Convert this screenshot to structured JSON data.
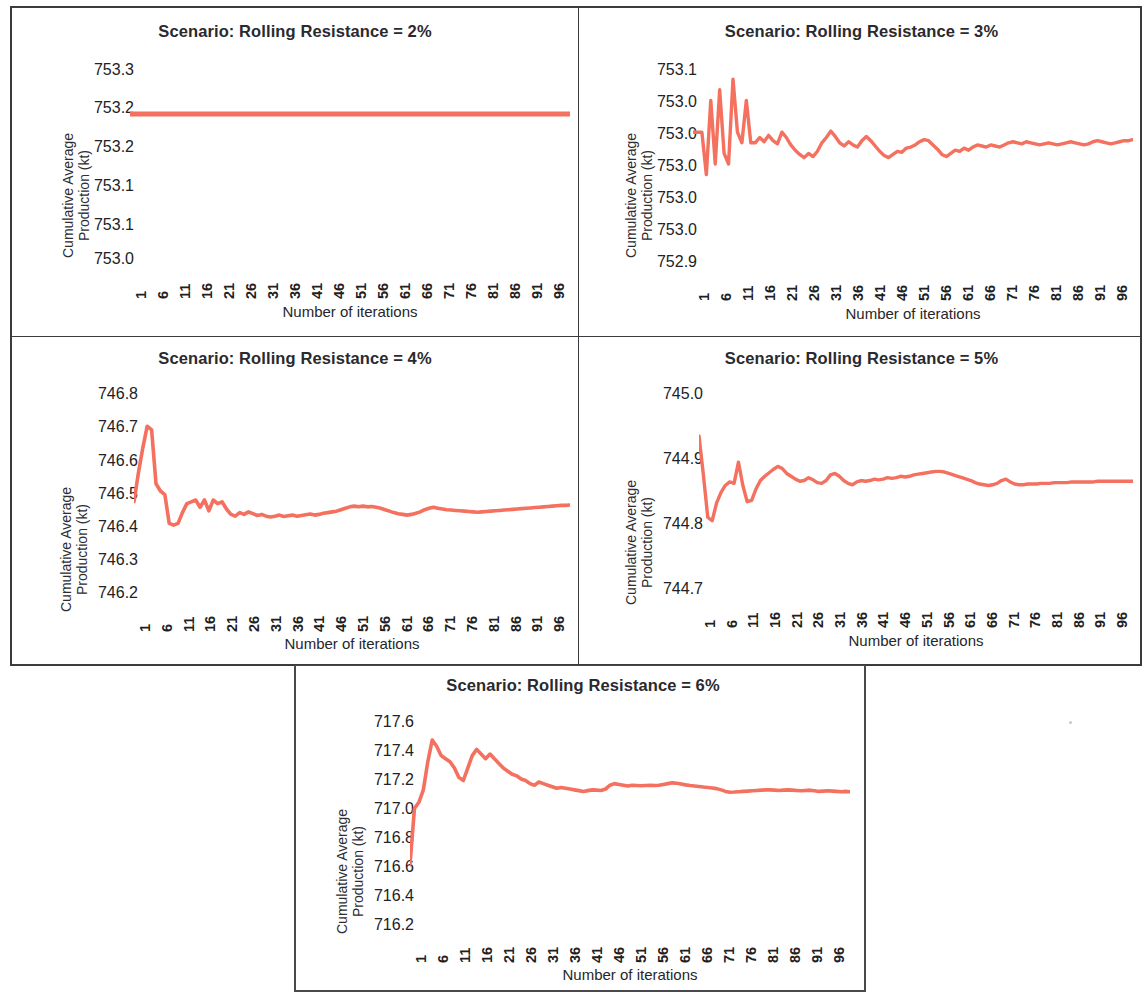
{
  "figure": {
    "panel_count": 5,
    "line_color": "#F4705F",
    "frame_color": "#3B3B3F",
    "background": "#FFFFFF",
    "shared_xlabel": "Number of iterations",
    "shared_ylabel_line1": "Cumulative Average",
    "shared_ylabel_line2": "Production (kt)",
    "shared_xticks": [
      "1",
      "6",
      "11",
      "16",
      "21",
      "26",
      "31",
      "36",
      "41",
      "46",
      "51",
      "56",
      "61",
      "66",
      "71",
      "76",
      "81",
      "86",
      "91",
      "96"
    ]
  },
  "chart_data": [
    {
      "id": "panel-1",
      "type": "line",
      "title": "Scenario: Rolling Resistance = 2%",
      "xlabel": "Number of iterations",
      "ylabel": "Cumulative Average Production (kt)",
      "ytick_labels": [
        "753.3",
        "753.2",
        "753.2",
        "753.1",
        "753.1",
        "753.0"
      ],
      "ylim": [
        753.0,
        753.3
      ],
      "xlim": [
        1,
        100
      ],
      "xtick_labels": [
        "1",
        "6",
        "11",
        "16",
        "21",
        "26",
        "31",
        "36",
        "41",
        "46",
        "51",
        "56",
        "61",
        "66",
        "71",
        "76",
        "81",
        "86",
        "91",
        "96"
      ],
      "grid": false,
      "legend": "none",
      "x": [
        1,
        2,
        3,
        4,
        5,
        6,
        7,
        8,
        9,
        10,
        11,
        12,
        13,
        14,
        15,
        16,
        17,
        18,
        19,
        20,
        21,
        22,
        23,
        24,
        25,
        26,
        27,
        28,
        29,
        30,
        31,
        32,
        33,
        34,
        35,
        36,
        37,
        38,
        39,
        40,
        41,
        42,
        43,
        44,
        45,
        46,
        47,
        48,
        49,
        50,
        51,
        52,
        53,
        54,
        55,
        56,
        57,
        58,
        59,
        60,
        61,
        62,
        63,
        64,
        65,
        66,
        67,
        68,
        69,
        70,
        71,
        72,
        73,
        74,
        75,
        76,
        77,
        78,
        79,
        80,
        81,
        82,
        83,
        84,
        85,
        86,
        87,
        88,
        89,
        90,
        91,
        92,
        93,
        94,
        95,
        96,
        97,
        98,
        99,
        100
      ],
      "values": [
        753.22,
        753.22,
        753.22,
        753.22,
        753.22,
        753.22,
        753.22,
        753.22,
        753.22,
        753.22,
        753.22,
        753.22,
        753.22,
        753.22,
        753.22,
        753.22,
        753.22,
        753.22,
        753.22,
        753.22,
        753.22,
        753.22,
        753.22,
        753.22,
        753.22,
        753.22,
        753.22,
        753.22,
        753.22,
        753.22,
        753.22,
        753.22,
        753.22,
        753.22,
        753.22,
        753.22,
        753.22,
        753.22,
        753.22,
        753.22,
        753.22,
        753.22,
        753.22,
        753.22,
        753.22,
        753.22,
        753.22,
        753.22,
        753.22,
        753.22,
        753.22,
        753.22,
        753.22,
        753.22,
        753.22,
        753.22,
        753.22,
        753.22,
        753.22,
        753.22,
        753.22,
        753.22,
        753.22,
        753.22,
        753.22,
        753.22,
        753.22,
        753.22,
        753.22,
        753.22,
        753.22,
        753.22,
        753.22,
        753.22,
        753.22,
        753.22,
        753.22,
        753.22,
        753.22,
        753.22,
        753.22,
        753.22,
        753.22,
        753.22,
        753.22,
        753.22,
        753.22,
        753.22,
        753.22,
        753.22,
        753.22,
        753.22,
        753.22,
        753.22,
        753.22,
        753.22,
        753.22,
        753.22,
        753.22,
        753.22
      ],
      "note": "Flat converged line at approximately 753.22 kt across all iterations"
    },
    {
      "id": "panel-2",
      "type": "line",
      "title": "Scenario: Rolling Resistance = 3%",
      "xlabel": "Number of iterations",
      "ylabel": "Cumulative Average Production (kt)",
      "ytick_labels": [
        "753.1",
        "753.0",
        "753.0",
        "753.0",
        "753.0",
        "753.0",
        "752.9"
      ],
      "ylim": [
        752.9,
        753.1
      ],
      "xlim": [
        1,
        100
      ],
      "xtick_labels": [
        "1",
        "6",
        "11",
        "16",
        "21",
        "26",
        "31",
        "36",
        "41",
        "46",
        "51",
        "56",
        "61",
        "66",
        "71",
        "76",
        "81",
        "86",
        "91",
        "96"
      ],
      "grid": false,
      "legend": "none",
      "values": [
        753.03,
        753.03,
        753.03,
        752.99,
        753.06,
        753.0,
        753.07,
        753.01,
        753.0,
        753.08,
        753.03,
        753.02,
        753.06,
        753.02,
        753.02,
        753.025,
        753.021,
        753.027,
        753.022,
        753.019,
        753.03,
        753.025,
        753.018,
        753.013,
        753.009,
        753.006,
        753.01,
        753.007,
        753.012,
        753.02,
        753.025,
        753.031,
        753.026,
        753.02,
        753.017,
        753.021,
        753.018,
        753.016,
        753.022,
        753.026,
        753.022,
        753.017,
        753.012,
        753.008,
        753.006,
        753.009,
        753.012,
        753.011,
        753.015,
        753.016,
        753.018,
        753.021,
        753.023,
        753.022,
        753.018,
        753.014,
        753.009,
        753.007,
        753.01,
        753.013,
        753.012,
        753.015,
        753.013,
        753.016,
        753.018,
        753.017,
        753.016,
        753.018,
        753.017,
        753.016,
        753.018,
        753.02,
        753.021,
        753.02,
        753.019,
        753.021,
        753.02,
        753.019,
        753.018,
        753.019,
        753.02,
        753.019,
        753.018,
        753.019,
        753.02,
        753.021,
        753.02,
        753.019,
        753.018,
        753.019,
        753.021,
        753.022,
        753.021,
        753.02,
        753.019,
        753.02,
        753.021,
        753.022,
        753.022,
        753.023
      ],
      "note": "High oscillation for first ~15 iterations then converging toward ~753.02 kt"
    },
    {
      "id": "panel-3",
      "type": "line",
      "title": "Scenario: Rolling Resistance = 4%",
      "xlabel": "Number of iterations",
      "ylabel": "Cumulative Average Production (kt)",
      "ytick_labels": [
        "746.8",
        "746.7",
        "746.6",
        "746.5",
        "746.4",
        "746.3",
        "746.2"
      ],
      "ylim": [
        746.2,
        746.8
      ],
      "xlim": [
        1,
        100
      ],
      "xtick_labels": [
        "1",
        "6",
        "11",
        "16",
        "21",
        "26",
        "31",
        "36",
        "41",
        "46",
        "51",
        "56",
        "61",
        "66",
        "71",
        "76",
        "81",
        "86",
        "91",
        "96"
      ],
      "grid": false,
      "legend": "none",
      "values": [
        746.47,
        746.55,
        746.62,
        746.68,
        746.67,
        746.52,
        746.5,
        746.49,
        746.41,
        746.405,
        746.41,
        746.44,
        746.465,
        746.47,
        746.475,
        746.455,
        746.475,
        746.445,
        746.475,
        746.465,
        746.47,
        746.45,
        746.435,
        746.43,
        746.44,
        746.435,
        746.442,
        746.437,
        746.432,
        746.435,
        746.43,
        746.428,
        746.43,
        746.433,
        746.429,
        746.431,
        746.433,
        746.43,
        746.432,
        746.434,
        746.436,
        746.433,
        746.435,
        746.438,
        746.44,
        746.442,
        746.444,
        746.448,
        746.452,
        746.456,
        746.458,
        746.456,
        746.458,
        746.456,
        746.457,
        746.455,
        746.452,
        746.448,
        746.444,
        746.44,
        746.437,
        746.435,
        746.433,
        746.435,
        746.438,
        746.442,
        746.448,
        746.452,
        746.455,
        746.452,
        746.45,
        746.448,
        746.447,
        746.446,
        746.445,
        746.444,
        746.443,
        746.442,
        746.441,
        746.442,
        746.443,
        746.444,
        746.445,
        746.446,
        746.447,
        746.448,
        746.449,
        746.45,
        746.451,
        746.452,
        746.453,
        746.454,
        746.455,
        746.456,
        746.457,
        746.458,
        746.459,
        746.46,
        746.46,
        746.461
      ],
      "note": "Sharp early peak near 746.68 at iteration 4-5, trough near 746.40, then converges to ~746.46 kt"
    },
    {
      "id": "panel-4",
      "type": "line",
      "title": "Scenario: Rolling Resistance = 5%",
      "xlabel": "Number of iterations",
      "ylabel": "Cumulative Average Production (kt)",
      "ytick_labels": [
        "745.0",
        "744.9",
        "744.8",
        "744.7"
      ],
      "ylim": [
        744.7,
        745.0
      ],
      "xlim": [
        1,
        100
      ],
      "xtick_labels": [
        "1",
        "6",
        "11",
        "16",
        "21",
        "26",
        "31",
        "36",
        "41",
        "46",
        "51",
        "56",
        "61",
        "66",
        "71",
        "76",
        "81",
        "86",
        "91",
        "96"
      ],
      "grid": false,
      "legend": "none",
      "values": [
        744.925,
        744.87,
        744.81,
        744.805,
        744.83,
        744.845,
        744.855,
        744.86,
        744.858,
        744.888,
        744.855,
        744.832,
        744.834,
        744.85,
        744.862,
        744.868,
        744.873,
        744.878,
        744.882,
        744.879,
        744.872,
        744.868,
        744.864,
        744.861,
        744.862,
        744.866,
        744.863,
        744.859,
        744.858,
        744.862,
        744.87,
        744.872,
        744.868,
        744.862,
        744.858,
        744.856,
        744.86,
        744.862,
        744.861,
        744.862,
        744.864,
        744.863,
        744.864,
        744.866,
        744.865,
        744.866,
        744.868,
        744.867,
        744.868,
        744.87,
        744.871,
        744.872,
        744.873,
        744.874,
        744.875,
        744.875,
        744.874,
        744.872,
        744.87,
        744.868,
        744.866,
        744.864,
        744.862,
        744.859,
        744.857,
        744.856,
        744.855,
        744.856,
        744.858,
        744.862,
        744.864,
        744.86,
        744.857,
        744.856,
        744.856,
        744.857,
        744.857,
        744.857,
        744.858,
        744.858,
        744.858,
        744.859,
        744.859,
        744.859,
        744.859,
        744.86,
        744.86,
        744.86,
        744.86,
        744.86,
        744.86,
        744.861,
        744.861,
        744.861,
        744.861,
        744.861,
        744.861,
        744.861,
        744.861,
        744.861
      ],
      "note": "Starts high at ~744.93, dips to ~744.80 around iteration 4, converges to ~744.86 kt"
    },
    {
      "id": "panel-5",
      "type": "line",
      "title": "Scenario: Rolling Resistance = 6%",
      "xlabel": "Number of iterations",
      "ylabel": "Cumulative Average Production (kt)",
      "ytick_labels": [
        "717.6",
        "717.4",
        "717.2",
        "717.0",
        "716.8",
        "716.6",
        "716.4",
        "716.2"
      ],
      "ylim": [
        716.2,
        717.6
      ],
      "xlim": [
        1,
        100
      ],
      "xtick_labels": [
        "1",
        "6",
        "11",
        "16",
        "21",
        "26",
        "31",
        "36",
        "41",
        "46",
        "51",
        "56",
        "61",
        "66",
        "71",
        "76",
        "81",
        "86",
        "91",
        "96"
      ],
      "grid": false,
      "legend": "none",
      "values": [
        716.62,
        716.98,
        717.02,
        717.1,
        717.28,
        717.42,
        717.38,
        717.32,
        717.3,
        717.28,
        717.24,
        717.18,
        717.16,
        717.24,
        717.32,
        717.36,
        717.33,
        717.3,
        717.33,
        717.3,
        717.27,
        717.24,
        717.22,
        717.2,
        717.19,
        717.17,
        717.16,
        717.14,
        717.13,
        717.15,
        717.14,
        717.13,
        717.12,
        717.11,
        717.115,
        717.11,
        717.105,
        717.1,
        717.095,
        717.09,
        717.095,
        717.1,
        717.098,
        717.096,
        717.105,
        717.13,
        717.14,
        717.135,
        717.13,
        717.125,
        717.13,
        717.128,
        717.126,
        717.128,
        717.13,
        717.128,
        717.13,
        717.135,
        717.14,
        717.145,
        717.142,
        717.138,
        717.132,
        717.128,
        717.125,
        717.122,
        717.118,
        717.115,
        717.112,
        717.108,
        717.1,
        717.09,
        717.085,
        717.086,
        717.088,
        717.09,
        717.092,
        717.094,
        717.096,
        717.098,
        717.1,
        717.1,
        717.098,
        717.096,
        717.098,
        717.1,
        717.098,
        717.096,
        717.094,
        717.096,
        717.098,
        717.094,
        717.09,
        717.092,
        717.094,
        717.092,
        717.09,
        717.088,
        717.09,
        717.088
      ],
      "note": "Rapid rise from 716.62 to peak 717.42 near iteration 6, then decays to ~717.09 kt"
    }
  ]
}
